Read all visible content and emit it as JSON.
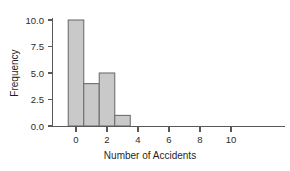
{
  "chart_data": {
    "type": "bar",
    "title": "",
    "subtitle": "",
    "xlabel": "Number of Accidents",
    "ylabel": "Frequency",
    "categories": [
      "0",
      "1",
      "2",
      "3"
    ],
    "values": [
      10,
      4,
      5,
      1
    ],
    "bin_centers": [
      0,
      1,
      2,
      3
    ],
    "bin_width": 1,
    "xlim": [
      -0.9,
      11.8
    ],
    "ylim": [
      0,
      10.6
    ],
    "xticks": [
      0,
      2,
      4,
      6,
      8,
      10
    ],
    "xtick_labels": [
      "0",
      "2",
      "4",
      "6",
      "8",
      "10"
    ],
    "yticks": [
      0,
      2.5,
      5,
      7.5,
      10
    ],
    "ytick_labels": [
      "0.0",
      "2.5",
      "5.0",
      "7.5",
      "10.0"
    ],
    "grid": false,
    "legend": false,
    "legend_position": "none",
    "series": [
      {
        "name": "Frequency",
        "values": [
          10,
          4,
          5,
          1
        ]
      }
    ],
    "colors": {
      "bar_fill": "#c9c9c9",
      "bar_edge": "#6e6e6e",
      "axis": "#595959",
      "text": "#2b2b2b",
      "background": "#ffffff"
    }
  }
}
